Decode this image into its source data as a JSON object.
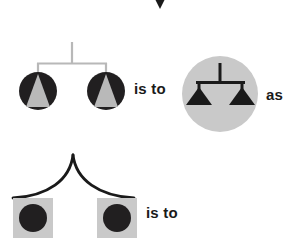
{
  "page": {
    "background_color": "#ffffff",
    "width": 305,
    "height": 244
  },
  "colors": {
    "black": "#1a1a1a",
    "dark_fill": "#211f20",
    "light_gray": "#c9c9c9",
    "mid_gray": "#b3b3b3",
    "frame_gray": "#b8b8b8",
    "white": "#ffffff"
  },
  "labels": {
    "is_to_first": "is to",
    "as": "as",
    "is_to_second": "is to"
  },
  "figures": {
    "top_fragment": {
      "name": "partial-diamond-fragment",
      "description": "black downward chevron cropped by top edge",
      "x": 151,
      "y": 0,
      "width": 18,
      "height": 9,
      "color": "#1a1a1a"
    },
    "mobile_a": {
      "name": "gray-frame-mobile-with-circled-triangles",
      "description": "light gray square mobile frame hanging two black circles each containing a gray triangle",
      "stem_x": 72,
      "stem_top": 42,
      "beam_y": 63,
      "beam_left": 38,
      "beam_right": 106,
      "drop_bottom": 73,
      "frame_color": "#b8b8b8",
      "items": [
        {
          "name": "black-circle-with-gray-triangle",
          "cx": 38,
          "cy": 91,
          "r": 19,
          "circle_color": "#211f20",
          "triangle_color": "#b9b9b9"
        },
        {
          "name": "black-circle-with-gray-triangle",
          "cx": 106,
          "cy": 91,
          "r": 19,
          "circle_color": "#211f20",
          "triangle_color": "#b9b9b9"
        }
      ]
    },
    "answer_a": {
      "name": "gray-disc-with-black-balance-scale",
      "description": "large light gray filled circle containing a black mobile with two solid inverted triangle pans",
      "cx": 220,
      "cy": 94,
      "r": 38,
      "disc_color": "#c9c9c9",
      "stem_x": 220,
      "stem_top": 63,
      "beam_y": 82,
      "beam_left": 197,
      "beam_right": 244,
      "pan_top": 88,
      "pan_bottom": 105,
      "pan_half_width": 13,
      "scale_color": "#1a1a1a"
    },
    "mobile_b": {
      "name": "black-curved-mobile-with-squared-circles",
      "description": "black curved arms peaking at center, hanging two light gray squares each containing a black circle",
      "apex_x": 73,
      "apex_y": 155,
      "left_end_x": 13,
      "right_end_x": 134,
      "arm_end_y": 198,
      "arm_color": "#1a1a1a",
      "items": [
        {
          "name": "gray-square-with-black-circle",
          "x": 13,
          "y": 198,
          "size": 40,
          "square_color": "#c9c9c9",
          "circle_color": "#211f20",
          "circle_r": 14
        },
        {
          "name": "gray-square-with-black-circle",
          "x": 97,
          "y": 198,
          "size": 40,
          "square_color": "#c9c9c9",
          "circle_color": "#211f20",
          "circle_r": 14
        }
      ]
    },
    "answer_b": {
      "name": "missing-answer-slot",
      "description": "no figure drawn after the second 'is to' — answer is blank"
    }
  }
}
